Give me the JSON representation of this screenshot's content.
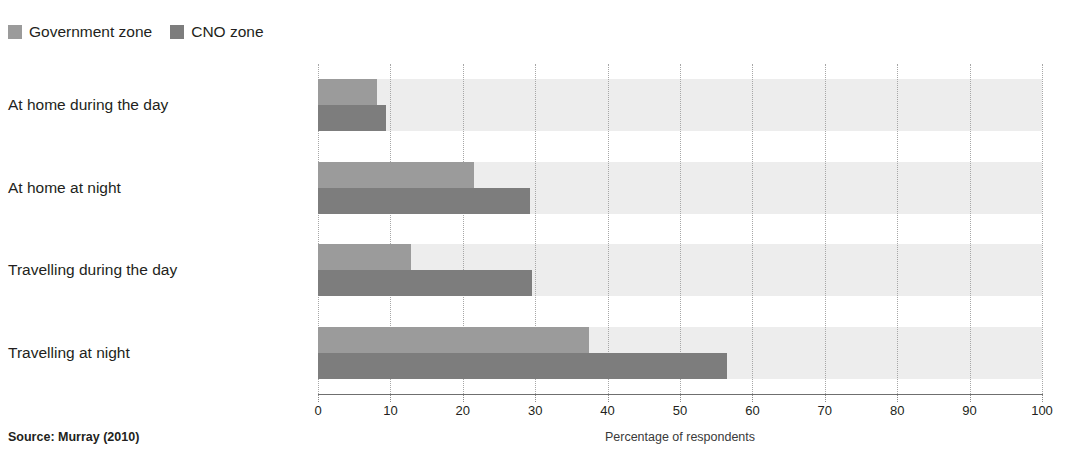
{
  "chart_data": {
    "type": "bar",
    "orientation": "horizontal",
    "title": "",
    "subtitle": "",
    "xlabel": "Percentage of respondents",
    "ylabel": "",
    "xlim": [
      0,
      100
    ],
    "xticks": [
      0,
      10,
      20,
      30,
      40,
      50,
      60,
      70,
      80,
      90,
      100
    ],
    "xtick_labels": [
      "0",
      "10",
      "20",
      "30",
      "40",
      "50",
      "60",
      "70",
      "80",
      "90",
      "100"
    ],
    "grid": "vertical-dotted",
    "legend_position": "top-left",
    "categories": [
      "At home during the day",
      "At home at night",
      "Travelling during the day",
      "Travelling at night"
    ],
    "series": [
      {
        "name": "Government zone",
        "color": "#9b9b9b",
        "values": [
          8.1,
          21.5,
          12.8,
          37.4
        ]
      },
      {
        "name": "CNO zone",
        "color": "#7d7d7d",
        "values": [
          9.4,
          29.3,
          29.5,
          56.5
        ]
      }
    ],
    "band_color": "#ededed",
    "source": "Source: Murray (2010)"
  },
  "legend": {
    "items": [
      {
        "label": "Government zone",
        "swatch": "legend-swatch-government"
      },
      {
        "label": "CNO zone",
        "swatch": "legend-swatch-cno"
      }
    ]
  },
  "footer": {
    "source": "Source: Murray (2010)",
    "axis_title": "Percentage of respondents"
  }
}
